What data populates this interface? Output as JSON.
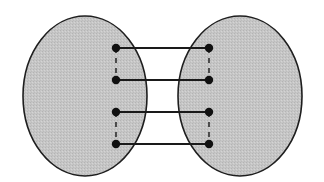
{
  "diagram": {
    "type": "two-sets-bipartite-matching",
    "colors": {
      "background": "#ffffff",
      "set_fill": "#c6c6c6",
      "set_stroke": "#1e1e1e",
      "node": "#111111",
      "edge": "#1a1a1a"
    },
    "sets": [
      {
        "id": "left-set",
        "cx": 85,
        "cy": 96,
        "rx": 62,
        "ry": 80
      },
      {
        "id": "right-set",
        "cx": 240,
        "cy": 96,
        "rx": 62,
        "ry": 80
      }
    ],
    "left_nodes": [
      {
        "x": 116,
        "y": 48
      },
      {
        "x": 116,
        "y": 80
      },
      {
        "x": 116,
        "y": 112
      },
      {
        "x": 116,
        "y": 144
      }
    ],
    "right_nodes": [
      {
        "x": 209,
        "y": 48
      },
      {
        "x": 209,
        "y": 80
      },
      {
        "x": 209,
        "y": 112
      },
      {
        "x": 209,
        "y": 144
      }
    ],
    "solid_edges": [
      {
        "from": 0,
        "to": 0
      },
      {
        "from": 1,
        "to": 1
      },
      {
        "from": 2,
        "to": 2
      },
      {
        "from": 3,
        "to": 3
      }
    ],
    "dashed_edges": [
      {
        "side": "left",
        "from": 0,
        "to": 1
      },
      {
        "side": "left",
        "from": 2,
        "to": 3
      },
      {
        "side": "right",
        "from": 0,
        "to": 1
      },
      {
        "side": "right",
        "from": 2,
        "to": 3
      }
    ]
  }
}
